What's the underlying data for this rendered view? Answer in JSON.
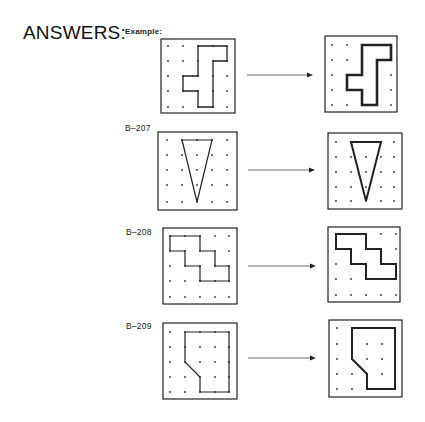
{
  "heading": "ANSWERS:",
  "example_label": "Example:",
  "problems": [
    {
      "id": "example",
      "label": "Example:"
    },
    {
      "id": "B-207",
      "label": "B–207"
    },
    {
      "id": "B-208",
      "label": "B–208"
    },
    {
      "id": "B-209",
      "label": "B–209"
    }
  ],
  "grid": {
    "rows": 5,
    "cols": 5,
    "dot_color": "#333333",
    "line_color": "#222222"
  },
  "rows": [
    {
      "label": "Example:",
      "left": {
        "box": [
          161,
          39,
          74,
          74
        ],
        "dots_x": [
          168,
          183,
          198,
          213,
          227
        ],
        "dots_y": [
          46,
          61,
          76,
          91,
          107
        ],
        "shape": [
          [
            2,
            0
          ],
          [
            4,
            0
          ],
          [
            4,
            1
          ],
          [
            3,
            1
          ],
          [
            3,
            4
          ],
          [
            2,
            4
          ],
          [
            2,
            3
          ],
          [
            1,
            3
          ],
          [
            1,
            2
          ],
          [
            2,
            2
          ]
        ],
        "stroke": 1.3
      },
      "right": {
        "box": [
          325,
          36,
          72,
          76
        ],
        "dots_x": [
          332,
          347,
          362,
          377,
          391
        ],
        "dots_y": [
          45,
          60,
          75,
          90,
          105
        ],
        "shape": [
          [
            2,
            0
          ],
          [
            4,
            0
          ],
          [
            4,
            1
          ],
          [
            3,
            1
          ],
          [
            3,
            4
          ],
          [
            2,
            4
          ],
          [
            2,
            3
          ],
          [
            1,
            3
          ],
          [
            1,
            2
          ],
          [
            2,
            2
          ]
        ],
        "stroke": 2.6
      },
      "arrow": [
        247,
        75,
        313
      ]
    },
    {
      "label": "B–207",
      "left": {
        "box": [
          158,
          132,
          79,
          78
        ],
        "dots_x": [
          167,
          182,
          197,
          212,
          227
        ],
        "dots_y": [
          140,
          155,
          170,
          185,
          202
        ],
        "shape": [
          [
            1,
            0
          ],
          [
            3,
            0
          ],
          [
            2,
            4
          ]
        ],
        "stroke": 1.2
      },
      "right": {
        "box": [
          328,
          133,
          74,
          76
        ],
        "dots_x": [
          336,
          351,
          366,
          381,
          394
        ],
        "dots_y": [
          142,
          157,
          172,
          187,
          201
        ],
        "shape": [
          [
            1,
            0
          ],
          [
            3,
            0
          ],
          [
            2,
            4
          ]
        ],
        "stroke": 2.0
      },
      "arrow": [
        248,
        170,
        315
      ]
    },
    {
      "label": "B–208",
      "left": {
        "box": [
          163,
          228,
          74,
          76
        ],
        "dots_x": [
          170,
          185,
          200,
          215,
          229
        ],
        "dots_y": [
          236,
          251,
          266,
          281,
          297
        ],
        "shape": [
          [
            0,
            0
          ],
          [
            2,
            0
          ],
          [
            2,
            1
          ],
          [
            3,
            1
          ],
          [
            3,
            2
          ],
          [
            4,
            2
          ],
          [
            4,
            3
          ],
          [
            2,
            3
          ],
          [
            2,
            2
          ],
          [
            1,
            2
          ],
          [
            1,
            1
          ],
          [
            0,
            1
          ]
        ],
        "stroke": 1.2
      },
      "right": {
        "box": [
          328,
          227,
          72,
          75
        ],
        "dots_x": [
          336,
          351,
          366,
          381,
          396
        ],
        "dots_y": [
          234,
          249,
          264,
          279,
          295
        ],
        "shape": [
          [
            0,
            0
          ],
          [
            2,
            0
          ],
          [
            2,
            1
          ],
          [
            3,
            1
          ],
          [
            3,
            2
          ],
          [
            4,
            2
          ],
          [
            4,
            3
          ],
          [
            2,
            3
          ],
          [
            2,
            2
          ],
          [
            1,
            2
          ],
          [
            1,
            1
          ],
          [
            0,
            1
          ]
        ],
        "stroke": 2.0
      },
      "arrow": [
        248,
        266,
        316
      ]
    },
    {
      "label": "B–209",
      "left": {
        "box": [
          163,
          323,
          74,
          76
        ],
        "dots_x": [
          170,
          185,
          200,
          215,
          229
        ],
        "dots_y": [
          332,
          347,
          362,
          377,
          392
        ],
        "shape": [
          [
            1,
            0
          ],
          [
            4,
            0
          ],
          [
            4,
            4
          ],
          [
            2,
            4
          ],
          [
            2,
            3
          ],
          [
            1,
            2
          ]
        ],
        "stroke": 1.2
      },
      "right": {
        "box": [
          329,
          320,
          73,
          77
        ],
        "dots_x": [
          337,
          352,
          367,
          382,
          395
        ],
        "dots_y": [
          328,
          344,
          359,
          374,
          389
        ],
        "shape": [
          [
            1,
            0
          ],
          [
            4,
            0
          ],
          [
            4,
            4
          ],
          [
            2,
            4
          ],
          [
            2,
            3
          ],
          [
            1,
            2
          ]
        ],
        "stroke": 2.0
      },
      "arrow": [
        248,
        358,
        316
      ]
    }
  ]
}
